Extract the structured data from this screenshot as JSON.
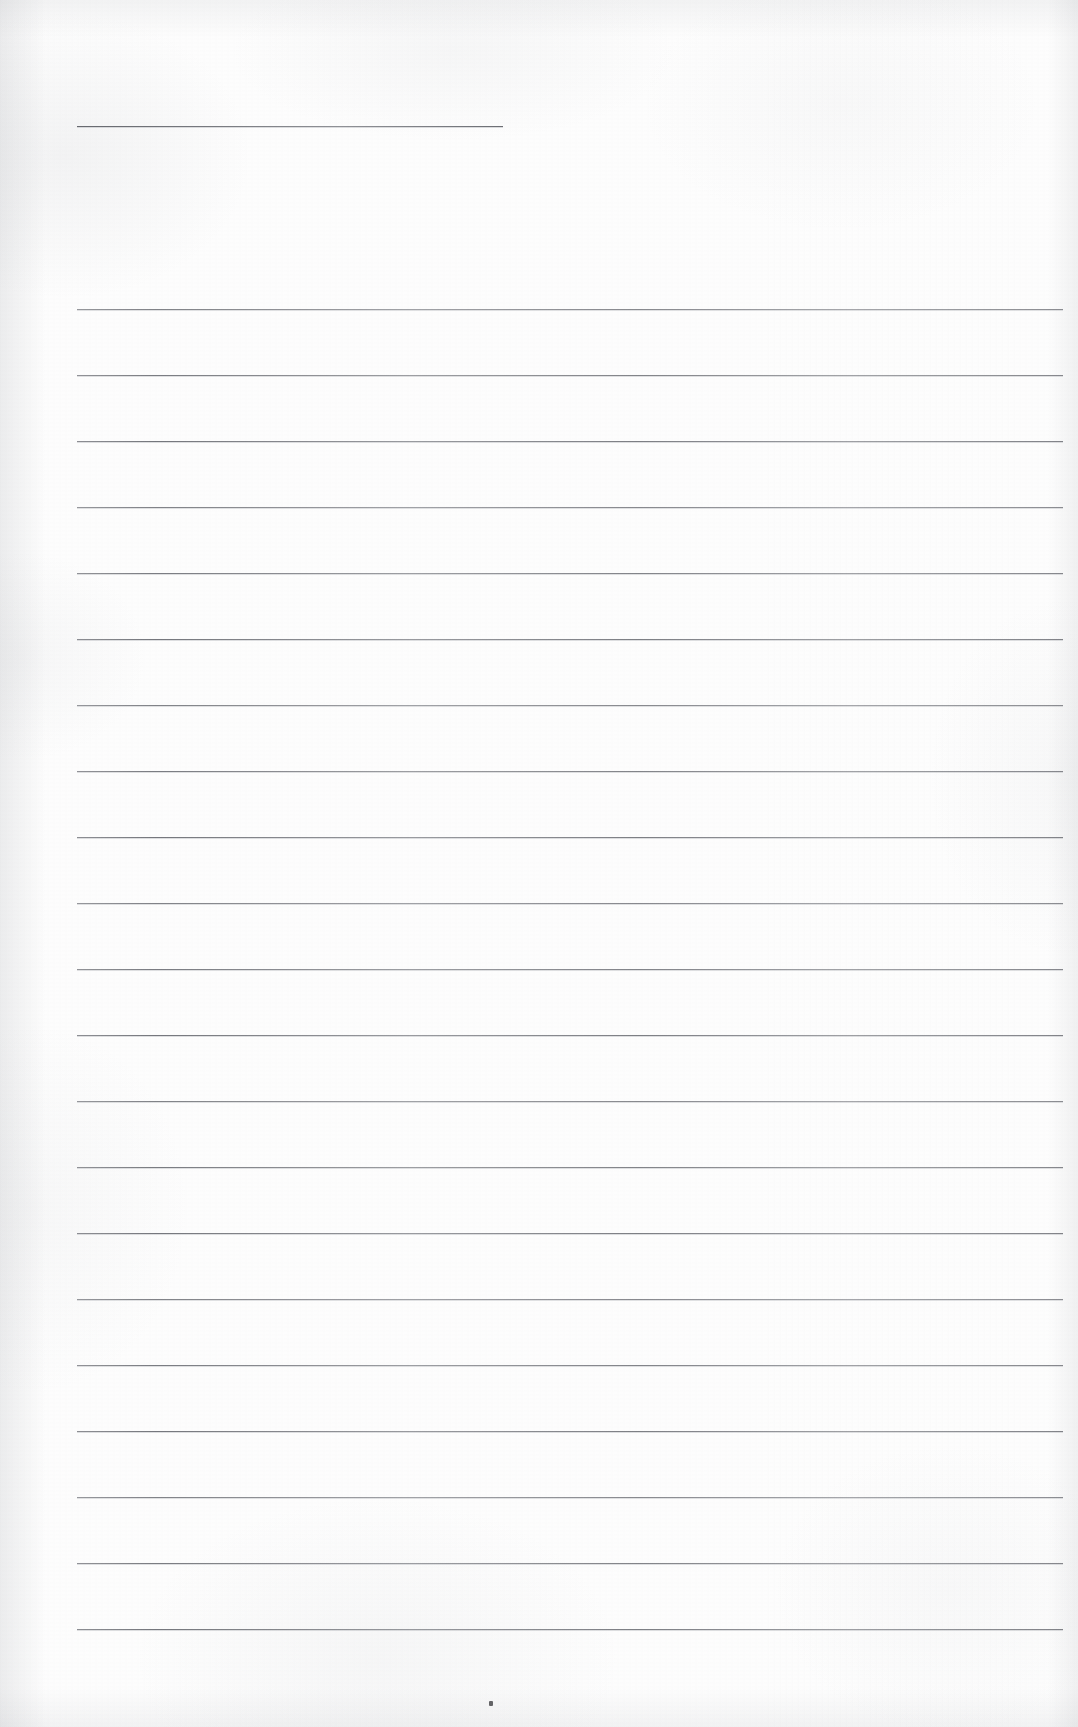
{
  "document": {
    "kind": "scanned-ruled-paper",
    "title": "Blank ruled notebook page (scan)",
    "visible_text": "",
    "page_width": 1078,
    "page_height": 1727
  },
  "paper": {
    "background_color": "#fdfdfd",
    "edge_shade_color": "#91949b",
    "texture": "light scan grain with faint mottling"
  },
  "rules": {
    "ink_color": "#6c6e74",
    "thickness_px": 1,
    "header_rule": {
      "label": "short top rule",
      "x_start": 77,
      "x_end": 503,
      "y": 126
    },
    "body_rules": {
      "label": "full-width ruled lines",
      "x_start": 77,
      "x_end": 1063,
      "first_y": 309,
      "spacing_px": 66,
      "count": 21,
      "y_positions": [
        309,
        375,
        441,
        507,
        573,
        639,
        705,
        771,
        837,
        903,
        969,
        1035,
        1101,
        1167,
        1233,
        1299,
        1365,
        1431,
        1497,
        1563,
        1629
      ]
    }
  },
  "marks": {
    "speck": {
      "label": "ink speck",
      "x": 489,
      "y": 1701,
      "color": "#4a4a4d"
    }
  }
}
